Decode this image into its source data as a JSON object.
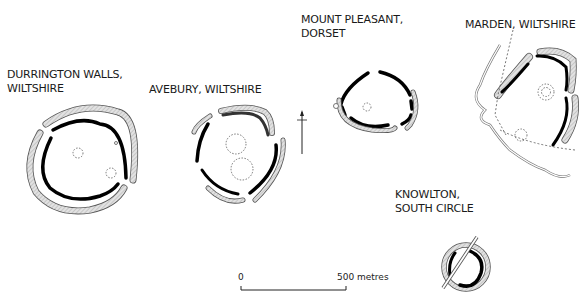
{
  "sites": [
    {
      "id": "durrington",
      "name_line1": "DURRINGTON WALLS,",
      "name_line2": "WILTSHIRE"
    },
    {
      "id": "avebury",
      "name_line1": "AVEBURY, WILTSHIRE",
      "name_line2": ""
    },
    {
      "id": "mount-pleasant",
      "name_line1": "MOUNT PLEASANT,",
      "name_line2": "DORSET"
    },
    {
      "id": "marden",
      "name_line1": "MARDEN, WILTSHIRE",
      "name_line2": ""
    },
    {
      "id": "knowlton",
      "name_line1": "KNOWLTON,",
      "name_line2": "SOUTH CIRCLE"
    }
  ],
  "scale_bar": {
    "start_label": "0",
    "end_label": "500 metres"
  },
  "north_arrow": {
    "direction": "north"
  },
  "colors": {
    "ditch": "#000000",
    "bank_fill": "#dcdcdc",
    "bank_stroke": "#555555",
    "dashed": "#555555"
  }
}
